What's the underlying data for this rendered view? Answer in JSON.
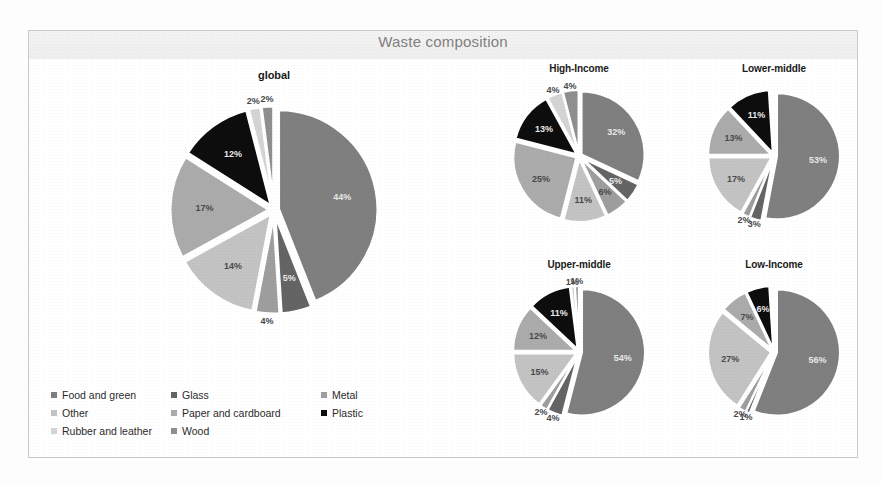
{
  "chart_title": "Waste composition",
  "colors": {
    "food_and_green": "#7f7f7f",
    "glass": "#646464",
    "metal": "#9e9e9e",
    "other": "#c3c3c3",
    "paper_and_cardboard": "#ababab",
    "plastic": "#0d0d0d",
    "rubber_and_leather": "#d4d4d4",
    "wood": "#8f8f8f",
    "frame_border": "#c9c9c9",
    "header_band": "#f1f1f1",
    "title_text": "#808080"
  },
  "legend": {
    "items": [
      {
        "label": "Food and green",
        "color": "#7f7f7f"
      },
      {
        "label": "Glass",
        "color": "#646464"
      },
      {
        "label": "Metal",
        "color": "#9e9e9e"
      },
      {
        "label": "Other",
        "color": "#c3c3c3"
      },
      {
        "label": "Paper and cardboard",
        "color": "#ababab"
      },
      {
        "label": "Plastic",
        "color": "#0d0d0d"
      },
      {
        "label": "Rubber and leather",
        "color": "#d4d4d4"
      },
      {
        "label": "Wood",
        "color": "#8f8f8f"
      }
    ]
  },
  "chart_data": [
    {
      "type": "pie",
      "title": "global",
      "categories": [
        "Food and green",
        "Glass",
        "Metal",
        "Other",
        "Paper and cardboard",
        "Plastic",
        "Rubber and leather",
        "Wood"
      ],
      "values": [
        44,
        5,
        4,
        14,
        17,
        12,
        2,
        2
      ],
      "labels": [
        "44%",
        "5%",
        "4%",
        "14%",
        "17%",
        "12%",
        "2%",
        "2%"
      ],
      "colors": [
        "#7f7f7f",
        "#646464",
        "#9e9e9e",
        "#c3c3c3",
        "#ababab",
        "#0d0d0d",
        "#d4d4d4",
        "#8f8f8f"
      ],
      "exploded": true,
      "legend_position": "bottom-left"
    },
    {
      "type": "pie",
      "title": "High-Income",
      "categories": [
        "Food and green",
        "Glass",
        "Metal",
        "Other",
        "Paper and cardboard",
        "Plastic",
        "Rubber and leather",
        "Wood"
      ],
      "values": [
        32,
        5,
        6,
        11,
        25,
        13,
        4,
        4
      ],
      "labels": [
        "32%",
        "5%",
        "6%",
        "11%",
        "25%",
        "13%",
        "4%",
        "4%"
      ],
      "colors": [
        "#7f7f7f",
        "#646464",
        "#9e9e9e",
        "#c3c3c3",
        "#ababab",
        "#0d0d0d",
        "#d4d4d4",
        "#8f8f8f"
      ],
      "exploded": true
    },
    {
      "type": "pie",
      "title": "Lower-middle",
      "categories": [
        "Food and green",
        "Glass",
        "Metal",
        "Other",
        "Paper and cardboard",
        "Plastic",
        "Rubber and leather",
        "Wood"
      ],
      "values": [
        53,
        3,
        2,
        17,
        13,
        11,
        0.5,
        0.5
      ],
      "labels": [
        "53%",
        "3%",
        "2%",
        "17%",
        "13%",
        "11%",
        "",
        ""
      ],
      "colors": [
        "#7f7f7f",
        "#646464",
        "#9e9e9e",
        "#c3c3c3",
        "#ababab",
        "#0d0d0d",
        "#d4d4d4",
        "#8f8f8f"
      ],
      "exploded": true
    },
    {
      "type": "pie",
      "title": "Upper-middle",
      "categories": [
        "Food and green",
        "Glass",
        "Metal",
        "Other",
        "Paper and cardboard",
        "Plastic",
        "Rubber and leather",
        "Wood"
      ],
      "values": [
        54,
        4,
        2,
        15,
        12,
        11,
        1,
        1
      ],
      "labels": [
        "54%",
        "4%",
        "2%",
        "15%",
        "12%",
        "11%",
        "1%",
        "1%"
      ],
      "colors": [
        "#7f7f7f",
        "#646464",
        "#9e9e9e",
        "#c3c3c3",
        "#ababab",
        "#0d0d0d",
        "#d4d4d4",
        "#8f8f8f"
      ],
      "exploded": true
    },
    {
      "type": "pie",
      "title": "Low-Income",
      "categories": [
        "Food and green",
        "Glass",
        "Metal",
        "Other",
        "Paper and cardboard",
        "Plastic",
        "Rubber and leather",
        "Wood"
      ],
      "values": [
        56,
        1,
        2,
        27,
        7,
        6,
        0.5,
        0.5
      ],
      "labels": [
        "56%",
        "1%",
        "2%",
        "27%",
        "7%",
        "6%",
        "",
        ""
      ],
      "colors": [
        "#7f7f7f",
        "#646464",
        "#9e9e9e",
        "#c3c3c3",
        "#ababab",
        "#0d0d0d",
        "#d4d4d4",
        "#8f8f8f"
      ],
      "exploded": true
    }
  ]
}
